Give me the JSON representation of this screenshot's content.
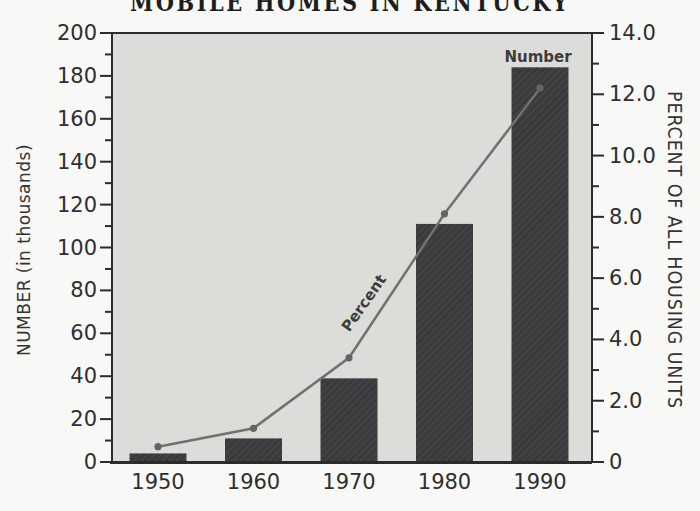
{
  "chart_data": {
    "type": "bar+line",
    "title": "MOBILE HOMES IN KENTUCKY",
    "categories": [
      "1950",
      "1960",
      "1970",
      "1980",
      "1990"
    ],
    "series": [
      {
        "name": "Number",
        "type": "bar",
        "axis": "left",
        "values": [
          4,
          11,
          39,
          111,
          184
        ]
      },
      {
        "name": "Percent",
        "type": "line",
        "axis": "right",
        "values": [
          0.5,
          1.1,
          3.4,
          8.1,
          12.2
        ]
      }
    ],
    "left_axis": {
      "title": "NUMBER (in thousands)",
      "min": 0,
      "max": 200,
      "major_step": 20,
      "minor_step": 10,
      "tick_labels": [
        "0",
        "20",
        "40",
        "60",
        "80",
        "100",
        "120",
        "140",
        "160",
        "180",
        "200"
      ]
    },
    "right_axis": {
      "title": "PERCENT OF ALL HOUSING UNITS",
      "min": 0,
      "max": 14,
      "major_step": 2,
      "minor_step": 1,
      "tick_labels": [
        "0",
        "2.0",
        "4.0",
        "6.0",
        "8.0",
        "10.0",
        "12.0",
        "14.0"
      ]
    },
    "x_axis": {
      "labels": [
        "1950",
        "1960",
        "1970",
        "1980",
        "1990"
      ]
    },
    "annotations": [
      {
        "text": "Percent",
        "series": "Percent"
      },
      {
        "text": "Number",
        "series": "Number"
      }
    ],
    "grid": false,
    "legend_position": "inline-annotations",
    "colors": {
      "bar": "#3a3a3c",
      "bar_texture": "#464649",
      "line": "#717174",
      "point": "#646467",
      "plot_background": "#dcdcd9",
      "frame": "#2b2b2b",
      "page_background": "#f8f8f6",
      "text": "#2f2f2f"
    }
  }
}
